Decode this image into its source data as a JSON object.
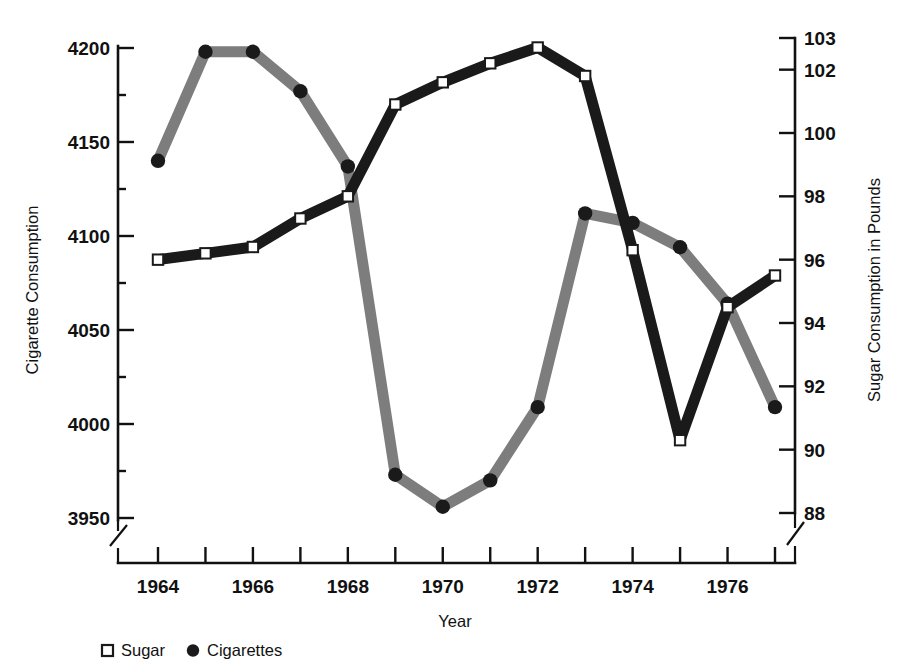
{
  "chart_data": {
    "type": "line",
    "title": "",
    "xlabel": "Year",
    "x": [
      1964,
      1965,
      1966,
      1967,
      1968,
      1969,
      1970,
      1971,
      1972,
      1973,
      1974,
      1975,
      1976,
      1977
    ],
    "xticks": [
      1964,
      1965,
      1966,
      1967,
      1968,
      1969,
      1970,
      1971,
      1972,
      1973,
      1974,
      1975,
      1976,
      1977
    ],
    "xticklabels": [
      "1964",
      "",
      "1966",
      "",
      "1968",
      "",
      "1970",
      "",
      "1972",
      "",
      "1974",
      "",
      "1976",
      ""
    ],
    "xlim": [
      1963.5,
      1977.5
    ],
    "grid": false,
    "axis_break_left": true,
    "axis_break_right": true,
    "axis_break_x": true,
    "legend": {
      "position": "below-left",
      "entries": [
        {
          "label": "Sugar",
          "marker": "open-square",
          "color": "#1a1a1a"
        },
        {
          "label": "Cigarettes",
          "marker": "filled-circle",
          "color": "#1a1a1a"
        }
      ]
    },
    "axes": [
      {
        "id": "left",
        "side": "left",
        "label": "Cigarette Consumption",
        "ticks": [
          3950,
          4000,
          4050,
          4100,
          4150,
          4200
        ],
        "ticklabels": [
          "3950",
          "4000",
          "4050",
          "4100",
          "4150",
          "4200"
        ],
        "lim": [
          3950,
          4200
        ],
        "minor_ticks": [
          3975,
          4025,
          4075,
          4125,
          4175
        ]
      },
      {
        "id": "right",
        "side": "right",
        "label": "Sugar Consumption in Pounds",
        "ticks": [
          88,
          90,
          92,
          94,
          96,
          98,
          100,
          102,
          103
        ],
        "ticklabels": [
          "88",
          "90",
          "92",
          "94",
          "96",
          "98",
          "100",
          "102",
          "103"
        ],
        "lim": [
          88,
          103
        ]
      }
    ],
    "series": [
      {
        "name": "Cigarettes",
        "axis": "left",
        "ylabel": "Cigarette Consumption",
        "color": "#7d7d7d",
        "marker": "filled-circle",
        "marker_color": "#1a1a1a",
        "values": [
          4140,
          4198,
          4198,
          4177,
          4137,
          3973,
          3956,
          3970,
          4009,
          4112,
          4107,
          4094,
          4064,
          4009
        ]
      },
      {
        "name": "Sugar",
        "axis": "right",
        "ylabel": "Sugar Consumption in Pounds",
        "color": "#1a1a1a",
        "marker": "open-square",
        "marker_color": "#ffffff",
        "values": [
          96.0,
          96.2,
          96.4,
          97.3,
          98.0,
          100.9,
          101.6,
          102.2,
          102.7,
          101.8,
          96.3,
          90.3,
          94.5,
          95.5
        ]
      }
    ]
  },
  "labels": {
    "y_left_title": "Cigarette Consumption",
    "y_right_title": "Sugar Consumption in Pounds",
    "x_title": "Year",
    "legend_sugar": "Sugar",
    "legend_cigarettes": "Cigarettes"
  },
  "ticks": {
    "left": [
      "4200",
      "4150",
      "4100",
      "4050",
      "4000",
      "3950"
    ],
    "right": [
      "103",
      "102",
      "100",
      "98",
      "96",
      "94",
      "92",
      "90",
      "88"
    ],
    "x": [
      "1964",
      "1966",
      "1968",
      "1970",
      "1972",
      "1974",
      "1976"
    ]
  },
  "colors": {
    "cigarettes_line": "#7d7d7d",
    "sugar_line": "#1a1a1a",
    "axis": "#111111",
    "background": "#ffffff"
  }
}
